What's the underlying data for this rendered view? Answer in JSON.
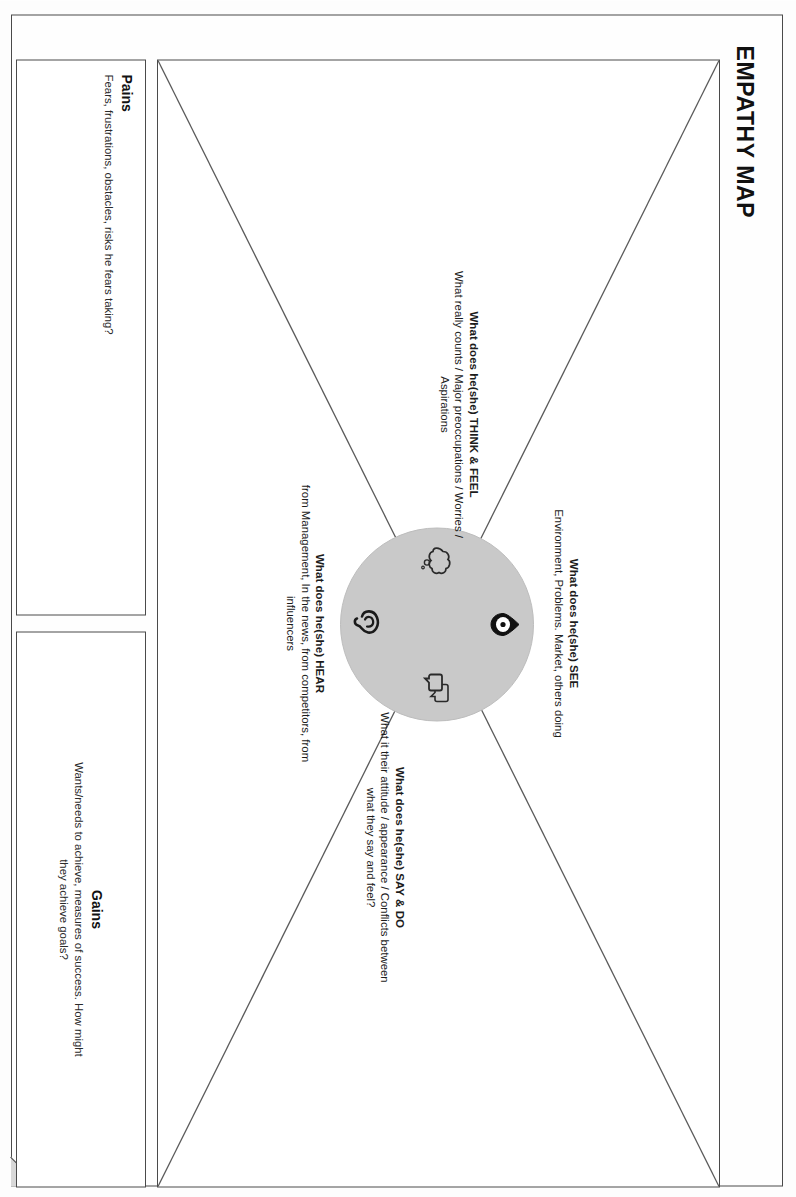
{
  "poster": {
    "title": "EMPATHY MAP"
  },
  "quadrants": [
    {
      "id": "see",
      "heading": "What does he(she) SEE",
      "body": "Environment, Problems. Market, others doing",
      "icon": "eye-icon"
    },
    {
      "id": "think_feel",
      "heading": "What does he(she) THINK & FEEL",
      "body": "What really counts / Major preoccupations / Worries / Aspirations",
      "icon": "thought-cloud-icon"
    },
    {
      "id": "say_do",
      "heading": "What does he(she) SAY & DO",
      "body": "What it their attitude / appearance / Conflicts between what they say and feel?",
      "icon": "speech-bubbles-icon"
    },
    {
      "id": "hear",
      "heading": "What does he(she) HEAR",
      "body": "from Management, In the news, from competitors, from influencers",
      "icon": "ear-icon"
    }
  ],
  "bottom_panels": {
    "pains": {
      "title": "Pains",
      "description": "Fears, frustrations, obstacles, risks he fears taking?"
    },
    "gains": {
      "title": "Gains",
      "description": "Wants/needs to achieve, measures of success. How might they achieve goals?"
    }
  },
  "colors": {
    "circle_fill": "#c9c9c9",
    "line": "#4a4a4a",
    "text": "#1a1a1a",
    "fold_fill": "#d8d8d8"
  }
}
